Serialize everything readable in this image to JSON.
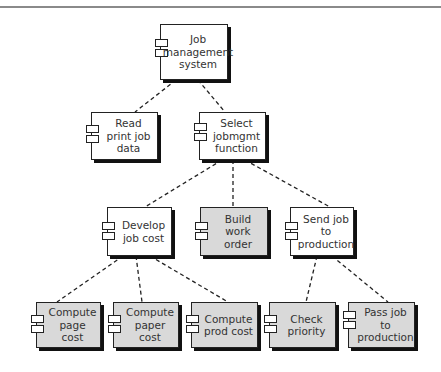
{
  "diagram": {
    "colors": {
      "shaded": "#d9d9d9",
      "plain": "#ffffff",
      "edge": "#222222",
      "rule": "#8a8a8a"
    },
    "nodes": [
      {
        "id": "root",
        "label": "Job\nmanagement\nsystem",
        "shaded": false
      },
      {
        "id": "read",
        "label": "Read\nprint job\ndata",
        "shaded": false
      },
      {
        "id": "select",
        "label": "Select\njobmgmt\nfunction",
        "shaded": false
      },
      {
        "id": "develop",
        "label": "Develop\njob cost",
        "shaded": false
      },
      {
        "id": "build",
        "label": "Build\nwork order",
        "shaded": true
      },
      {
        "id": "send",
        "label": "Send job\nto\nproduction",
        "shaded": false
      },
      {
        "id": "page",
        "label": "Compute\npage cost",
        "shaded": true
      },
      {
        "id": "paper",
        "label": "Compute\npaper cost",
        "shaded": true
      },
      {
        "id": "prod",
        "label": "Compute\nprod cost",
        "shaded": true
      },
      {
        "id": "check",
        "label": "Check\npriority",
        "shaded": true
      },
      {
        "id": "pass",
        "label": "Pass job to\nproduction",
        "shaded": true
      }
    ],
    "edges": [
      [
        "root",
        "read"
      ],
      [
        "root",
        "select"
      ],
      [
        "select",
        "develop"
      ],
      [
        "select",
        "build"
      ],
      [
        "select",
        "send"
      ],
      [
        "develop",
        "page"
      ],
      [
        "develop",
        "paper"
      ],
      [
        "develop",
        "prod"
      ],
      [
        "send",
        "check"
      ],
      [
        "send",
        "pass"
      ]
    ]
  }
}
